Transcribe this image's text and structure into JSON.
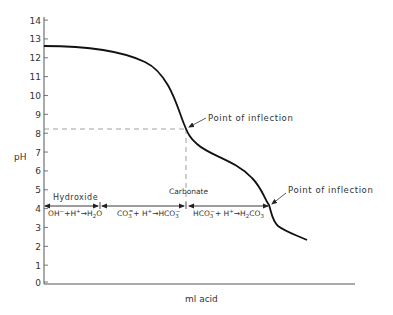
{
  "chart_data": {
    "type": "line",
    "title": "",
    "xlabel": "ml acid",
    "ylabel": "pH",
    "ylim": [
      0,
      14
    ],
    "yticks": [
      0,
      1,
      2,
      3,
      4,
      5,
      6,
      7,
      8,
      9,
      10,
      11,
      12,
      13,
      14
    ],
    "grid": false,
    "series": [
      {
        "name": "Titration curve",
        "x_px": [
          44,
          70,
          100,
          130,
          150,
          165,
          175,
          182,
          186,
          192,
          205,
          225,
          245,
          260,
          268,
          271,
          276,
          290,
          307
        ],
        "ph": [
          12.75,
          12.7,
          12.5,
          12.1,
          11.6,
          10.8,
          9.9,
          9.0,
          8.3,
          7.5,
          7.0,
          6.6,
          6.0,
          5.3,
          4.6,
          4.2,
          3.6,
          3.1,
          2.7
        ]
      }
    ],
    "annotations": [
      {
        "text": "Point of inflection",
        "ph": 8.3,
        "note": "first inflection (carbonate endpoint)"
      },
      {
        "text": "Point of inflection",
        "ph": 4.3,
        "note": "second inflection (bicarbonate endpoint)"
      },
      {
        "text": "Hydroxide",
        "region": "OH- + H+ -> H2O"
      },
      {
        "text": "Carbonate",
        "region": "CO3= + H+ -> HCO3-"
      },
      {
        "text": "",
        "region": "HCO3- + H+ -> H2CO3"
      }
    ],
    "reference_lines": [
      {
        "type": "horizontal-dashed",
        "ph": 8.3
      },
      {
        "type": "vertical-dashed",
        "at": "first inflection"
      }
    ]
  },
  "labels": {
    "ylabel": "pH",
    "xlabel": "ml acid",
    "inflection1": "Point of inflection",
    "inflection2": "Point of inflection",
    "hydroxide": "Hydroxide",
    "carbonate": "Carbonate"
  },
  "reactions": {
    "r1": {
      "a": "OH",
      "a_sup": "−",
      "b": "+H",
      "b_sup": "+",
      "arrow": "→",
      "c": "H",
      "c_sub": "2",
      "d": "O"
    },
    "r2": {
      "a": "CO",
      "a_sub": "3",
      "a_sup": "=",
      "b": "+ H",
      "b_sup": "+",
      "arrow": "→",
      "c": "HCO",
      "c_sub": "3",
      "c_sup": "−"
    },
    "r3": {
      "a": "HCO",
      "a_sub": "3",
      "a_sup": "−",
      "b": "+ H",
      "b_sup": "+",
      "arrow": "→",
      "c": "H",
      "c_sub": "2",
      "d": "CO",
      "d_sub": "3"
    }
  },
  "ticks": [
    "0",
    "1",
    "2",
    "3",
    "4",
    "5",
    "6",
    "7",
    "8",
    "9",
    "10",
    "11",
    "12",
    "13",
    "14"
  ]
}
